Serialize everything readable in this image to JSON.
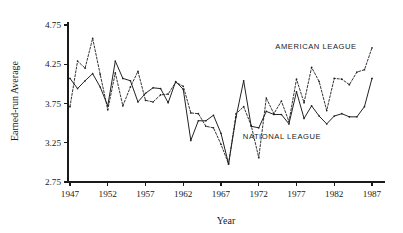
{
  "chart_data": {
    "type": "line",
    "title": "",
    "xlabel": "Year",
    "ylabel": "Earned-run Average",
    "xlim": [
      1946,
      1988
    ],
    "ylim": [
      2.75,
      4.75
    ],
    "grid": false,
    "legend_position": "inline-annotations",
    "x_ticks": [
      1947,
      1952,
      1957,
      1962,
      1967,
      1972,
      1977,
      1982,
      1987
    ],
    "x_tick_labels": [
      "1947",
      "1952",
      "1957",
      "1962",
      "1967",
      "1972",
      "1977",
      "1982",
      "1987"
    ],
    "y_ticks": [
      2.75,
      3.25,
      3.75,
      4.25,
      4.75
    ],
    "y_tick_labels": [
      "2.75",
      "3.25",
      "3.75",
      "4.25",
      "4.75"
    ],
    "x": [
      1947,
      1948,
      1949,
      1950,
      1951,
      1952,
      1953,
      1954,
      1955,
      1956,
      1957,
      1958,
      1959,
      1960,
      1961,
      1962,
      1963,
      1964,
      1965,
      1966,
      1967,
      1968,
      1969,
      1970,
      1971,
      1972,
      1973,
      1974,
      1975,
      1976,
      1977,
      1978,
      1979,
      1980,
      1981,
      1982,
      1983,
      1984,
      1985,
      1986,
      1987
    ],
    "series": [
      {
        "name": "AMERICAN LEAGUE",
        "style": "dashed",
        "annotation": "AMERICAN LEAGUE",
        "values": [
          3.71,
          4.29,
          4.2,
          4.58,
          4.12,
          3.67,
          4.14,
          3.72,
          3.96,
          4.16,
          3.79,
          3.77,
          3.86,
          3.87,
          4.02,
          3.97,
          3.63,
          3.62,
          3.46,
          3.44,
          3.23,
          2.98,
          3.62,
          3.71,
          3.47,
          3.06,
          3.82,
          3.62,
          3.78,
          3.52,
          4.06,
          3.76,
          4.21,
          4.03,
          3.66,
          4.07,
          4.06,
          3.99,
          4.15,
          4.18,
          4.46
        ]
      },
      {
        "name": "NATIONAL LEAGUE",
        "style": "solid",
        "annotation": "NATIONAL LEAGUE",
        "values": [
          4.07,
          3.94,
          4.04,
          4.13,
          3.96,
          3.72,
          4.29,
          4.07,
          4.04,
          3.77,
          3.88,
          3.95,
          3.94,
          3.76,
          4.03,
          3.93,
          3.28,
          3.53,
          3.53,
          3.6,
          3.37,
          2.98,
          3.58,
          4.04,
          3.46,
          3.44,
          3.65,
          3.61,
          3.61,
          3.49,
          3.9,
          3.56,
          3.72,
          3.59,
          3.49,
          3.59,
          3.62,
          3.58,
          3.58,
          3.71,
          4.07
        ]
      }
    ]
  },
  "axes": {
    "y_label": "Earned-run Average",
    "x_label": "Year"
  },
  "annotations": {
    "american": "AMERICAN LEAGUE",
    "national": "NATIONAL LEAGUE"
  },
  "colors": {
    "axis": "#1a1a1a",
    "american_league": "#333333",
    "national_league": "#222222",
    "background": "#ffffff"
  }
}
